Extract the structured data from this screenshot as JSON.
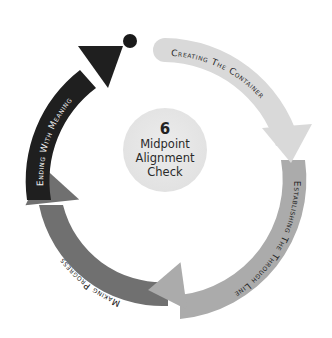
{
  "diagram": {
    "center": {
      "number": "6",
      "line1": "Midpoint",
      "line2": "Alignment",
      "line3": "Check"
    },
    "stages": [
      {
        "label": "Creating The Container",
        "color": "#d9d9d9",
        "text_color": "#2b2b2b"
      },
      {
        "label": "Establishing The Through Line",
        "color": "#ababab",
        "text_color": "#1e1e1e"
      },
      {
        "label": "Making Progress",
        "color": "#707070",
        "text_color": "#1a1a1a"
      },
      {
        "label": "Ending With Meaning",
        "color": "#1f1f1f",
        "text_color": "#f2f2f2"
      }
    ],
    "start_dot_color": "#1a1a1a"
  }
}
